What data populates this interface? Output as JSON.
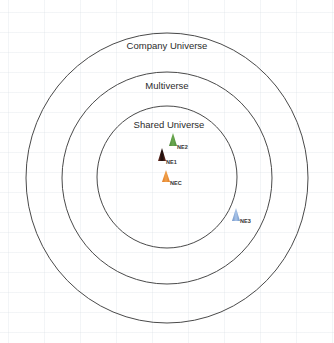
{
  "diagram": {
    "type": "concentric-circles",
    "rings": [
      {
        "id": "company-universe",
        "label": "Company Universe",
        "cx": 167,
        "cy": 178,
        "rx": 141,
        "ry": 145,
        "label_x": 167,
        "label_y": 41
      },
      {
        "id": "multiverse",
        "label": "Multiverse",
        "cx": 167,
        "cy": 178,
        "rx": 105,
        "ry": 106,
        "label_x": 167,
        "label_y": 81
      },
      {
        "id": "shared-universe",
        "label": "Shared Universe",
        "cx": 167,
        "cy": 177,
        "rx": 70,
        "ry": 71,
        "label_x": 169,
        "label_y": 120
      }
    ],
    "markers": [
      {
        "id": "NE2",
        "label": "NE2",
        "color": "#6aa84f",
        "color_dark": "#4e8a3a",
        "apex_x": 173,
        "apex_y": 133,
        "base_y": 146,
        "half_width": 4,
        "label_x": 177,
        "label_y": 145
      },
      {
        "id": "NE1",
        "label": "NE1",
        "color": "#1a0f0d",
        "color_dark": "#6b2a1e",
        "apex_x": 162,
        "apex_y": 148,
        "base_y": 161,
        "half_width": 4,
        "label_x": 166,
        "label_y": 160
      },
      {
        "id": "NEC",
        "label": "NEC",
        "color": "#f0a04b",
        "color_dark": "#e07b24",
        "apex_x": 166,
        "apex_y": 170,
        "base_y": 182,
        "half_width": 4,
        "label_x": 170,
        "label_y": 181
      },
      {
        "id": "NE3",
        "label": "NE3",
        "color": "#a9c4e8",
        "color_dark": "#6f93c8",
        "apex_x": 236,
        "apex_y": 208,
        "base_y": 221,
        "half_width": 4,
        "label_x": 240,
        "label_y": 219
      }
    ],
    "colors": {
      "ring_stroke": "#4a4a4a",
      "background": "#ffffff"
    }
  }
}
